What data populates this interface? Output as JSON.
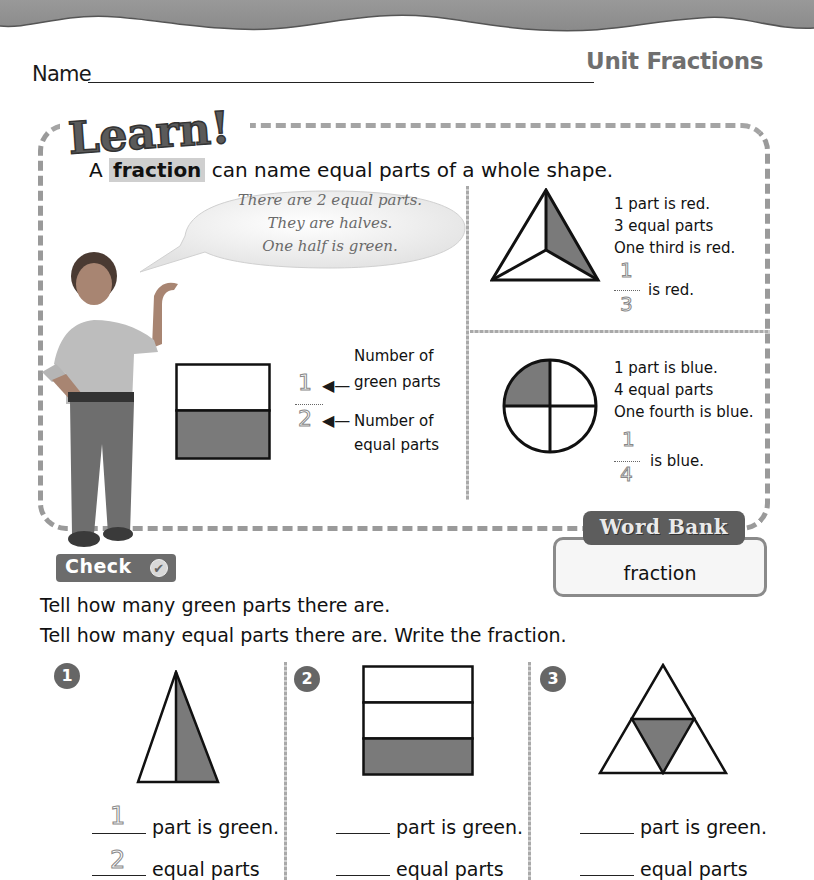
{
  "header": {
    "title": "Unit Fractions",
    "name_label": "Name"
  },
  "learn": {
    "logo_text": "Learn!",
    "intro_prefix": "A",
    "intro_keyword": "fraction",
    "intro_suffix": "can name equal parts of a whole shape.",
    "speech_bubble": [
      "There are 2 equal parts.",
      "They are halves.",
      "One half is green."
    ],
    "halves_example": {
      "numerator": "1",
      "denominator": "2",
      "numerator_label_line1": "Number of",
      "numerator_label_line2": "green parts",
      "denominator_label_line1": "Number of",
      "denominator_label_line2": "equal parts"
    },
    "thirds_example": {
      "lines": [
        "1 part is red.",
        "3 equal parts",
        "One third is red."
      ],
      "numerator": "1",
      "denominator": "3",
      "suffix": "is red."
    },
    "fourths_example": {
      "lines": [
        "1 part is blue.",
        "4 equal parts",
        "One fourth is blue."
      ],
      "numerator": "1",
      "denominator": "4",
      "suffix": "is blue."
    }
  },
  "word_bank": {
    "title": "Word Bank",
    "words": [
      "fraction"
    ]
  },
  "check": {
    "label": "Check",
    "icon": "checkmark-icon",
    "instructions": [
      "Tell how many green parts there are.",
      "Tell how many equal parts there are. Write the fraction."
    ],
    "exercises": [
      {
        "number": "1",
        "shape": "triangle-split-2",
        "green_parts": "1",
        "equal_parts": "2",
        "line1_suffix": "part is green.",
        "line2_suffix": "equal parts"
      },
      {
        "number": "2",
        "shape": "rectangle-split-3",
        "green_parts": "",
        "equal_parts": "",
        "line1_suffix": "part is green.",
        "line2_suffix": "equal parts"
      },
      {
        "number": "3",
        "shape": "triangle-split-4",
        "green_parts": "",
        "equal_parts": "",
        "line1_suffix": "part is green.",
        "line2_suffix": "equal parts"
      }
    ]
  },
  "colors": {
    "shaded": "#7a7a7a",
    "frame": "#9a9a9a",
    "band": "#8e8e8e",
    "title": "#6f6f6f"
  }
}
